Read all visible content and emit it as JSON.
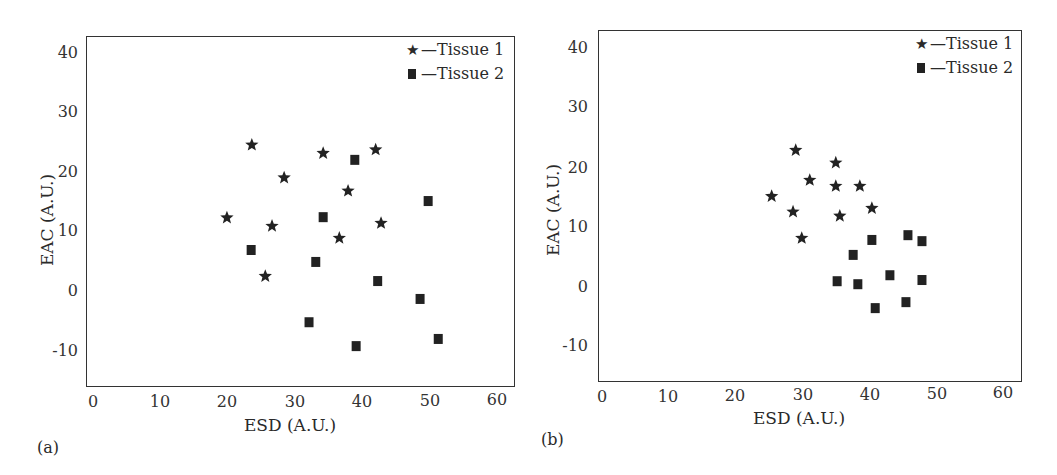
{
  "chart_data": [
    {
      "type": "scatter",
      "panel_label": "(a)",
      "title": "",
      "xlabel": "ESD (A.U.)",
      "ylabel": "EAC (A.U.)",
      "xlim": [
        -1,
        63
      ],
      "ylim": [
        -16,
        42
      ],
      "xticks": [
        0,
        10,
        20,
        30,
        40,
        50,
        60
      ],
      "yticks": [
        40,
        30,
        20,
        10,
        0,
        -10
      ],
      "grid": false,
      "legend_position": "upper right",
      "series": [
        {
          "name": "Tissue 1",
          "legend_label": "—Tissue 1",
          "marker": "star",
          "points": [
            [
              19.9,
              12.1
            ],
            [
              26.6,
              10.7
            ],
            [
              36.6,
              8.7
            ],
            [
              42.8,
              11.2
            ],
            [
              25.6,
              2.3
            ],
            [
              23.6,
              24.3
            ],
            [
              34.2,
              22.9
            ],
            [
              42.0,
              23.5
            ],
            [
              28.4,
              18.8
            ],
            [
              37.9,
              16.6
            ]
          ]
        },
        {
          "name": "Tissue 2",
          "legend_label": "—Tissue 2",
          "marker": "square",
          "points": [
            [
              38.9,
              21.8
            ],
            [
              49.8,
              14.9
            ],
            [
              34.2,
              12.2
            ],
            [
              23.5,
              6.7
            ],
            [
              33.1,
              4.7
            ],
            [
              42.3,
              1.5
            ],
            [
              48.6,
              -1.5
            ],
            [
              32.1,
              -5.4
            ],
            [
              39.1,
              -9.4
            ],
            [
              51.3,
              -8.2
            ]
          ]
        }
      ]
    },
    {
      "type": "scatter",
      "panel_label": "(b)",
      "title": "",
      "xlabel": "ESD (A.U.)",
      "ylabel": "EAC (A.U.)",
      "xlim": [
        -0.6,
        62.7
      ],
      "ylim": [
        -16,
        42.6
      ],
      "xticks": [
        0,
        10,
        20,
        30,
        40,
        50,
        60
      ],
      "yticks": [
        40,
        30,
        20,
        10,
        0,
        -10
      ],
      "grid": false,
      "legend_position": "upper right",
      "series": [
        {
          "name": "Tissue 1",
          "legend_label": "—Tissue 1",
          "marker": "star",
          "points": [
            [
              29.0,
              22.7
            ],
            [
              35.0,
              20.6
            ],
            [
              31.1,
              17.7
            ],
            [
              35.0,
              16.7
            ],
            [
              38.6,
              16.7
            ],
            [
              25.4,
              15.0
            ],
            [
              28.6,
              12.4
            ],
            [
              35.6,
              11.7
            ],
            [
              40.4,
              13.0
            ],
            [
              29.9,
              8.0
            ]
          ]
        },
        {
          "name": "Tissue 2",
          "legend_label": "—Tissue 2",
          "marker": "square",
          "points": [
            [
              40.4,
              7.7
            ],
            [
              45.8,
              8.5
            ],
            [
              47.9,
              7.5
            ],
            [
              37.6,
              5.2
            ],
            [
              43.1,
              1.8
            ],
            [
              47.9,
              1.0
            ],
            [
              35.2,
              0.8
            ],
            [
              38.3,
              0.3
            ],
            [
              40.9,
              -3.7
            ],
            [
              45.5,
              -2.7
            ]
          ]
        }
      ]
    }
  ],
  "colors": {
    "marker": "#222222",
    "axis": "#333333",
    "background": "#ffffff"
  }
}
